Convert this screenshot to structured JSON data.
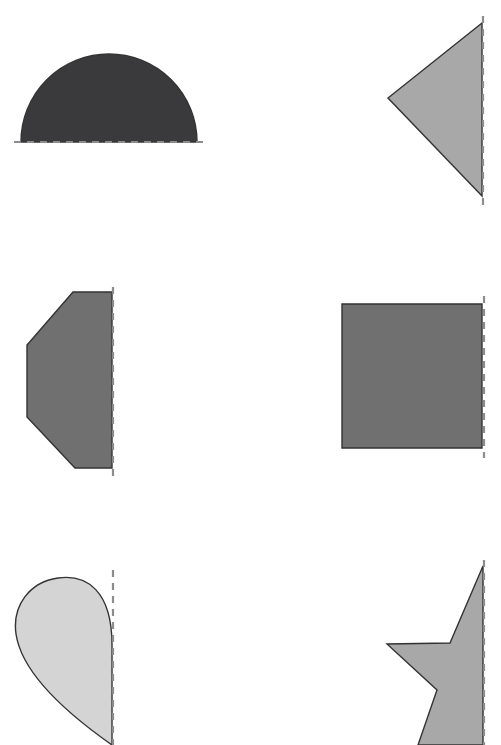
{
  "page": {
    "width": 501,
    "height": 745,
    "background_color": "#ffffff"
  },
  "style": {
    "outline_color": "#333333",
    "outline_width": 1.4,
    "mirror_line_color": "#8c8c8c",
    "mirror_line_width": 2.2,
    "mirror_line_dash": "7,6"
  },
  "palette": {
    "dark_charcoal": "#3a3a3c",
    "medium_gray": "#707070",
    "light_gray": "#a8a8a8",
    "pale_gray": "#d4d4d4"
  },
  "shapes": [
    {
      "id": "shape-1",
      "name": "half-semicircle",
      "label": "semicircle",
      "fill": "#3a3a3c",
      "mirror_orientation": "horizontal",
      "mirror_line": {
        "x1": 14,
        "y1": 142,
        "x2": 205,
        "y2": 142
      },
      "path": "M 21 142 A 88 88 0 0 1 197 142 Z",
      "geometry": {
        "center_x": 109,
        "center_y": 142,
        "radius": 88
      }
    },
    {
      "id": "shape-2",
      "name": "half-triangle",
      "label": "triangle",
      "fill": "#a8a8a8",
      "mirror_orientation": "vertical",
      "mirror_line": {
        "x1": 483,
        "y1": 16,
        "x2": 483,
        "y2": 206
      },
      "path": "M 482 23 L 388 98 L 482 196 Z",
      "geometry": {
        "apex_x": 388,
        "apex_y": 98,
        "top_y": 23,
        "bottom_y": 196
      }
    },
    {
      "id": "shape-3",
      "name": "half-octagon",
      "label": "octagon",
      "fill": "#707070",
      "mirror_orientation": "vertical",
      "mirror_line": {
        "x1": 113,
        "y1": 287,
        "x2": 113,
        "y2": 478
      },
      "path": "M 112 292 L 73 292 L 27 345 L 27 417 L 75 468 L 112 468 Z",
      "geometry": {
        "top_y": 292,
        "bottom_y": 468,
        "left_x": 27,
        "right_x": 112
      }
    },
    {
      "id": "shape-4",
      "name": "half-rectangle",
      "label": "rectangle",
      "fill": "#707070",
      "mirror_orientation": "vertical",
      "mirror_line": {
        "x1": 484,
        "y1": 296,
        "x2": 484,
        "y2": 458
      },
      "path": "M 342 304 L 482 304 L 482 448 L 342 448 Z",
      "geometry": {
        "left_x": 342,
        "right_x": 482,
        "top_y": 304,
        "bottom_y": 448
      }
    },
    {
      "id": "shape-5",
      "name": "half-heart",
      "label": "heart",
      "fill": "#d4d4d4",
      "mirror_orientation": "vertical",
      "mirror_line": {
        "x1": 113,
        "y1": 570,
        "x2": 113,
        "y2": 745
      },
      "path": "M 112 645 C 112 590 86 574 58 578 C 30 582 12 605 16 634 C 21 668 55 705 112 745 Z",
      "geometry": {
        "left_x": 16,
        "right_x": 112,
        "top_y": 578
      }
    },
    {
      "id": "shape-6",
      "name": "half-star",
      "label": "star",
      "fill": "#a8a8a8",
      "mirror_orientation": "vertical",
      "mirror_line": {
        "x1": 484,
        "y1": 560,
        "x2": 484,
        "y2": 745
      },
      "path": "M 483 566 L 450 643 L 387 644 L 437 690 L 418 745 L 483 745 Z",
      "geometry": {
        "tip_y": 566,
        "left_x": 387
      }
    }
  ]
}
